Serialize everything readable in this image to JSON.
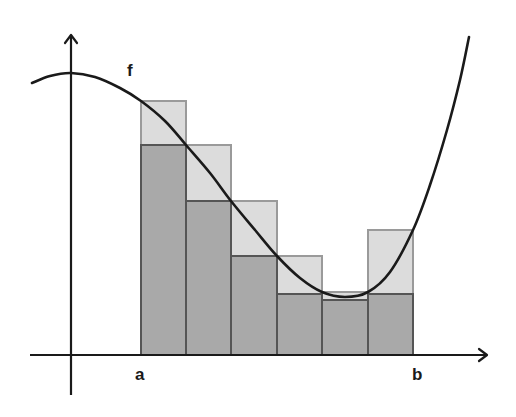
{
  "diagram": {
    "title": "",
    "labels": {
      "function": "f",
      "left_bound": "a",
      "right_bound": "b"
    },
    "colors": {
      "background": "#ffffff",
      "axis": "#1a1a1a",
      "curve": "#1a1a1a",
      "upper_rect_fill": "#dcdcdc",
      "upper_rect_stroke": "#9a9a9a",
      "lower_rect_fill": "#a9a9a9",
      "lower_rect_stroke": "#555555"
    },
    "axes": {
      "x_axis": {
        "y": 355,
        "x_start": 30,
        "x_end": 487
      },
      "y_axis": {
        "x": 71,
        "y_start": 395,
        "y_end": 35
      }
    },
    "partition_x": [
      141,
      186,
      231,
      277,
      322,
      368,
      413
    ],
    "rectangles": [
      {
        "index": 1,
        "upper_top": 101,
        "lower_top": 145
      },
      {
        "index": 2,
        "upper_top": 145,
        "lower_top": 201
      },
      {
        "index": 3,
        "upper_top": 201,
        "lower_top": 256
      },
      {
        "index": 4,
        "upper_top": 256,
        "lower_top": 294
      },
      {
        "index": 5,
        "upper_top": 292,
        "lower_top": 300
      },
      {
        "index": 6,
        "upper_top": 230,
        "lower_top": 294
      }
    ],
    "curve_points": [
      [
        32,
        83
      ],
      [
        50,
        76
      ],
      [
        71,
        73
      ],
      [
        95,
        77
      ],
      [
        120,
        88
      ],
      [
        141,
        101
      ],
      [
        165,
        121
      ],
      [
        186,
        145
      ],
      [
        210,
        173
      ],
      [
        231,
        201
      ],
      [
        255,
        230
      ],
      [
        277,
        256
      ],
      [
        300,
        278
      ],
      [
        322,
        292
      ],
      [
        345,
        297
      ],
      [
        368,
        292
      ],
      [
        390,
        272
      ],
      [
        413,
        230
      ],
      [
        430,
        185
      ],
      [
        447,
        130
      ],
      [
        460,
        80
      ],
      [
        469,
        37
      ]
    ]
  }
}
